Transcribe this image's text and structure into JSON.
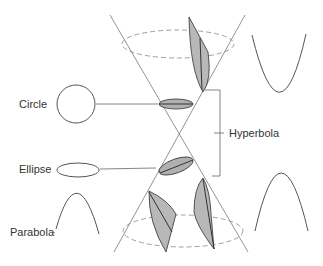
{
  "diagram": {
    "labels": {
      "circle": "Circle",
      "ellipse": "Ellipse",
      "parabola": "Parabola",
      "hyperbola": "Hyperbola"
    },
    "colors": {
      "line": "#555555",
      "fill": "#b8b8b8",
      "dashed": "#888888"
    }
  }
}
